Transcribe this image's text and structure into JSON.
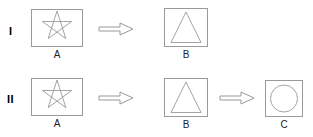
{
  "figure": {
    "background_color": "#ffffff",
    "stroke_color": "#808080",
    "shape_stroke_color": "#9a9a9a",
    "text_color": "#000000",
    "arrow_stroke_color": "#999999",
    "arrow_fill_color": "#ffffff",
    "width": 313,
    "height": 137
  },
  "rows": [
    {
      "id": "row-1",
      "label": "I",
      "steps": [
        {
          "id": "I-A",
          "caption": "A",
          "shape": "pentagram-in-square"
        },
        {
          "id": "I-B",
          "caption": "B",
          "shape": "triangle-in-square"
        }
      ],
      "arrows": [
        {
          "id": "I-arrow-1",
          "direction": "right",
          "from": "A",
          "to": "B"
        }
      ]
    },
    {
      "id": "row-2",
      "label": "II",
      "steps": [
        {
          "id": "II-A",
          "caption": "A",
          "shape": "pentagram-in-square"
        },
        {
          "id": "II-B",
          "caption": "B",
          "shape": "triangle-in-square"
        },
        {
          "id": "II-C",
          "caption": "C",
          "shape": "circle-in-square"
        }
      ],
      "arrows": [
        {
          "id": "II-arrow-1",
          "direction": "right",
          "from": "A",
          "to": "B"
        },
        {
          "id": "II-arrow-2",
          "direction": "right",
          "from": "B",
          "to": "C"
        }
      ]
    }
  ]
}
